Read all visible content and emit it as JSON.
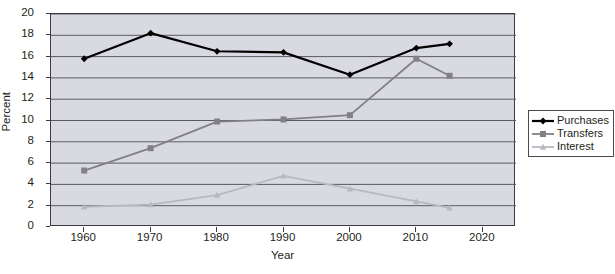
{
  "chart_data": {
    "type": "line",
    "title": "",
    "xlabel": "Year",
    "ylabel": "Percent",
    "x": [
      1960,
      1970,
      1980,
      1990,
      2000,
      2010,
      2015
    ],
    "xlim": [
      1955,
      2025
    ],
    "ylim": [
      0,
      20
    ],
    "xticks": [
      1960,
      1970,
      1980,
      1990,
      2000,
      2010,
      2020
    ],
    "yticks": [
      0,
      2,
      4,
      6,
      8,
      10,
      12,
      14,
      16,
      18,
      20
    ],
    "grid": "horizontal",
    "legend_position": "right",
    "series": [
      {
        "name": "Purchases",
        "color": "#000000",
        "marker": "diamond",
        "values": [
          15.8,
          18.2,
          16.5,
          16.4,
          14.3,
          16.8,
          17.2
        ]
      },
      {
        "name": "Transfers",
        "color": "#808086",
        "marker": "square",
        "values": [
          5.3,
          7.4,
          9.9,
          10.1,
          10.5,
          15.8,
          14.2
        ]
      },
      {
        "name": "Interest",
        "color": "#b8b8c0",
        "marker": "triangle",
        "values": [
          1.9,
          2.1,
          3.0,
          4.8,
          3.6,
          2.4,
          1.8
        ]
      }
    ]
  },
  "axes": {
    "y_title": "Percent",
    "x_title": "Year",
    "y_tick_labels": [
      "0",
      "2",
      "4",
      "6",
      "8",
      "10",
      "12",
      "14",
      "16",
      "18",
      "20"
    ],
    "x_tick_labels": [
      "1960",
      "1970",
      "1980",
      "1990",
      "2000",
      "2010",
      "2020"
    ]
  },
  "legend": {
    "items": [
      {
        "label": "Purchases"
      },
      {
        "label": "Transfers"
      },
      {
        "label": "Interest"
      }
    ]
  },
  "colors": {
    "plot_background": "#d9d9e1",
    "page_background": "#ffffff",
    "axis": "#3b3b41",
    "gridline": "#5a5a62",
    "series_purchases": "#000000",
    "series_transfers": "#808086",
    "series_interest": "#b8b8c0"
  }
}
